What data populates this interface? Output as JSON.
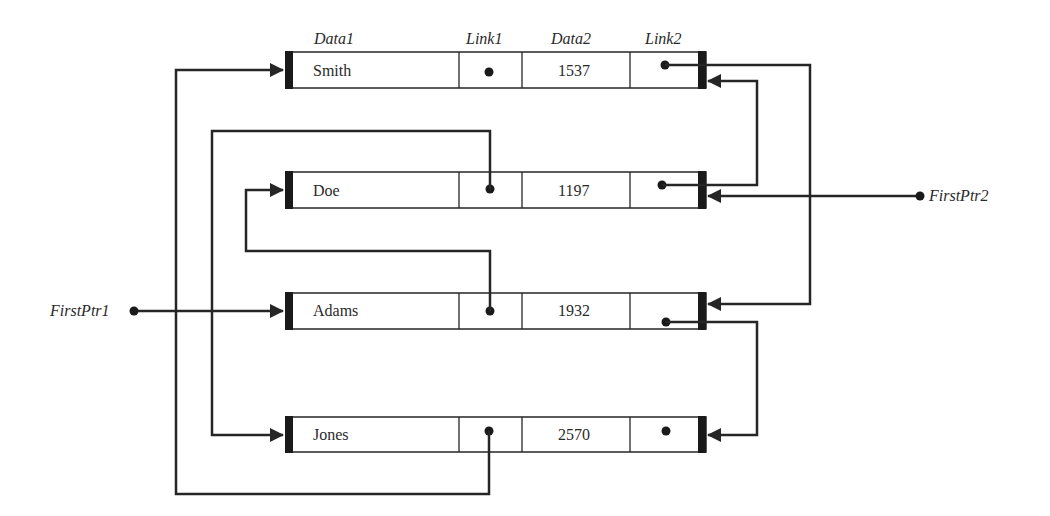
{
  "diagram": {
    "type": "doubly-linked list (two independent orderings)",
    "column_headers": {
      "data1": "Data1",
      "link1": "Link1",
      "data2": "Data2",
      "link2": "Link2"
    },
    "nodes": [
      {
        "id": "smith",
        "data1": "Smith",
        "data2": "1537",
        "link1": "null",
        "link2": "doe"
      },
      {
        "id": "doe",
        "data1": "Doe",
        "data2": "1197",
        "link1": "jones",
        "link2": "smith"
      },
      {
        "id": "adams",
        "data1": "Adams",
        "data2": "1932",
        "link1": "doe",
        "link2": "jones"
      },
      {
        "id": "jones",
        "data1": "Jones",
        "data2": "2570",
        "link1": "smith",
        "link2": "null"
      }
    ],
    "pointers": {
      "first1": {
        "label": "FirstPtr1",
        "target": "adams"
      },
      "first2": {
        "label": "FirstPtr2",
        "target": "doe"
      }
    },
    "colors": {
      "line": "#262626",
      "background": "#ffffff"
    }
  }
}
